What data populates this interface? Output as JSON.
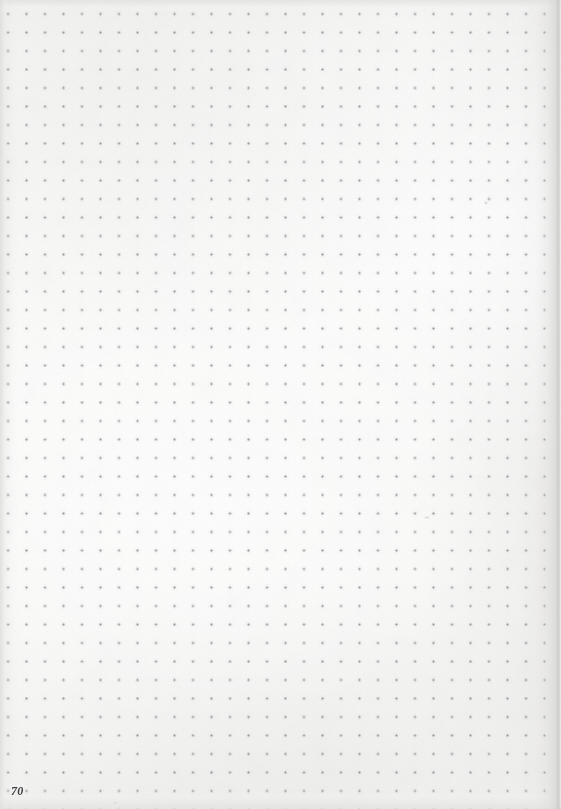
{
  "document": {
    "kind": "scanned-notebook-page",
    "page_number": "70",
    "width": 561,
    "height": 809,
    "paper_color": "#fbfbfa",
    "description": "Blank dot-grid notebook page, scanned"
  },
  "grid": {
    "type": "dot-grid",
    "dot_color": "#78787e",
    "spacing_px": 18.5,
    "origin_x": 8,
    "origin_y": 14,
    "columns": 30,
    "rows": 43,
    "dot_radius_px": 1.1
  },
  "page_number": {
    "label": "70",
    "x": 11,
    "y": 784,
    "font_size_px": 12,
    "color": "#3b3b3d"
  },
  "artifacts": {
    "right_edge_shadow": "#cbcbca",
    "left_edge_shadow": "#dcdcdb",
    "marks": [
      {
        "name": "stray-mark-upper-right",
        "x": 484,
        "y": 201,
        "w": 4,
        "h": 4,
        "opacity": 0.3
      },
      {
        "name": "stray-mark-mid-right",
        "x": 424,
        "y": 516,
        "w": 6,
        "h": 3,
        "opacity": 0.26
      },
      {
        "name": "stray-mark-lower-left",
        "x": 113,
        "y": 802,
        "w": 4,
        "h": 2,
        "opacity": 0.22
      }
    ]
  }
}
